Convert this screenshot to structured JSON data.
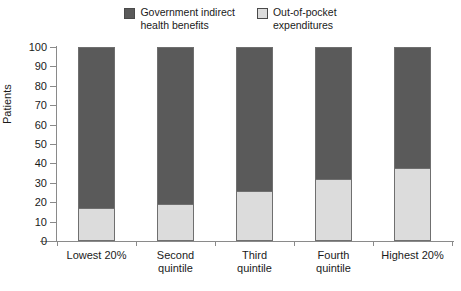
{
  "chart_data": {
    "type": "bar",
    "subtype": "stacked-bar",
    "title": "",
    "xlabel": "",
    "ylabel": "Patients",
    "ylim": [
      0,
      100
    ],
    "yticks": [
      0,
      10,
      20,
      30,
      40,
      50,
      60,
      70,
      80,
      90,
      100
    ],
    "grid": false,
    "legend_position": "top-center",
    "categories": [
      "Lowest 20%",
      "Second\nquintile",
      "Third\nquintile",
      "Fourth\nquintile",
      "Highest 20%"
    ],
    "series": [
      {
        "name": "Out-of-pocket\nexpenditures",
        "color": "#dcdcdc",
        "values": [
          17,
          19,
          26,
          32,
          37.5
        ]
      },
      {
        "name": "Government indirect\nhealth benefits",
        "color": "#5a5a5a",
        "values": [
          83,
          81,
          74,
          68,
          62.5
        ]
      }
    ],
    "totals": [
      100,
      100,
      100,
      100,
      100
    ]
  },
  "legend": {
    "entries": [
      {
        "label": "Government indirect\nhealth benefits",
        "color": "#5a5a5a"
      },
      {
        "label": "Out-of-pocket\nexpenditures",
        "color": "#dcdcdc"
      }
    ]
  },
  "axes": {
    "y_title": "Patients",
    "y_tick_labels": [
      "100",
      "90",
      "80",
      "70",
      "60",
      "50",
      "40",
      "30",
      "20",
      "10",
      "0"
    ],
    "x_tick_labels": [
      "Lowest 20%",
      "Second\nquintile",
      "Third\nquintile",
      "Fourth\nquintile",
      "Highest 20%"
    ]
  },
  "colors": {
    "dark_segment": "#5a5a5a",
    "light_segment": "#dcdcdc",
    "segment_border": "#6f6f6f",
    "axis_line": "#8a8a8a",
    "text": "#1a1a1a",
    "background": "#ffffff"
  }
}
